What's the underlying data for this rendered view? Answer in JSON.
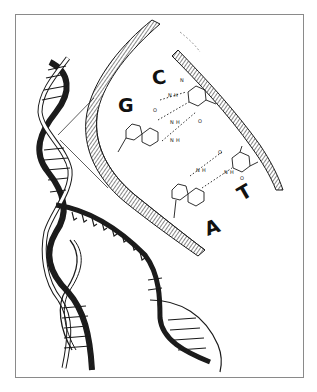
{
  "figure": {
    "base_labels": {
      "g": "G",
      "c": "C",
      "a": "A",
      "t": "T"
    },
    "atom_labels": {
      "n": "N",
      "h": "H",
      "o": "O"
    },
    "colors": {
      "ink": "#1a1a1a",
      "frame": "#8a8a8a",
      "background": "#ffffff"
    }
  }
}
